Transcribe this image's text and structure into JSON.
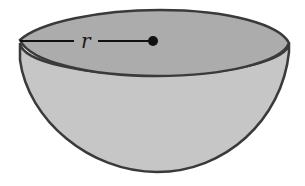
{
  "figure": {
    "shape": "hemisphere",
    "radius_label": "r",
    "colors": {
      "outline": "#3a3a3a",
      "top_fill": "#a9a9a9",
      "body_fill": "#c4c4c4",
      "radius_line": "#111111"
    }
  }
}
